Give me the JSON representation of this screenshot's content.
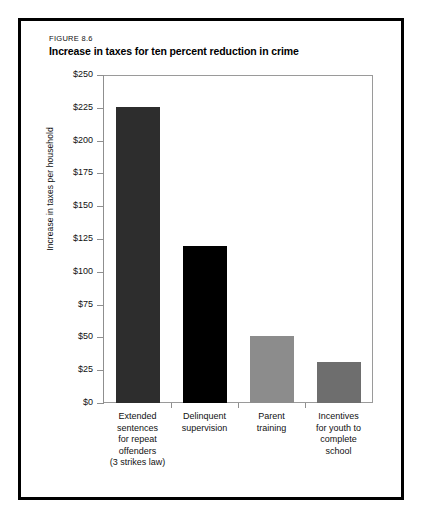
{
  "figure": {
    "number": "FIGURE 8.6",
    "title": "Increase in taxes for ten percent reduction in crime"
  },
  "chart_data": {
    "type": "bar",
    "title": "Increase in taxes for ten percent reduction in crime",
    "xlabel": "",
    "ylabel": "Increase in taxes per household",
    "ylim": [
      0,
      250
    ],
    "ytick_step": 25,
    "ytick_labels": [
      "$250",
      "$225",
      "$200",
      "$175",
      "$150",
      "$125",
      "$100",
      "$75",
      "$50",
      "$25",
      "$0"
    ],
    "ytick_values": [
      250,
      225,
      200,
      175,
      150,
      125,
      100,
      75,
      50,
      25,
      0
    ],
    "grid": false,
    "legend": "none",
    "categories": [
      "Extended sentences for repeat offenders (3 strikes law)",
      "Delinquent supervision",
      "Parent training",
      "Incentives for youth to complete school"
    ],
    "category_lines": [
      [
        "Extended",
        "sentences",
        "for repeat",
        "offenders",
        "(3 strikes law)"
      ],
      [
        "Delinquent",
        "supervision"
      ],
      [
        "Parent",
        "training"
      ],
      [
        "Incentives",
        "for youth to",
        "complete",
        "school"
      ]
    ],
    "values": [
      226,
      120,
      51,
      31
    ],
    "bar_colors": [
      "#2d2d2d",
      "#000000",
      "#8c8c8c",
      "#6e6e6e"
    ]
  },
  "colors": {
    "frame": "#000000",
    "plot_border": "#9a9a9a",
    "axis": "#8f8f8f",
    "text": "#111111",
    "background": "#ffffff"
  }
}
